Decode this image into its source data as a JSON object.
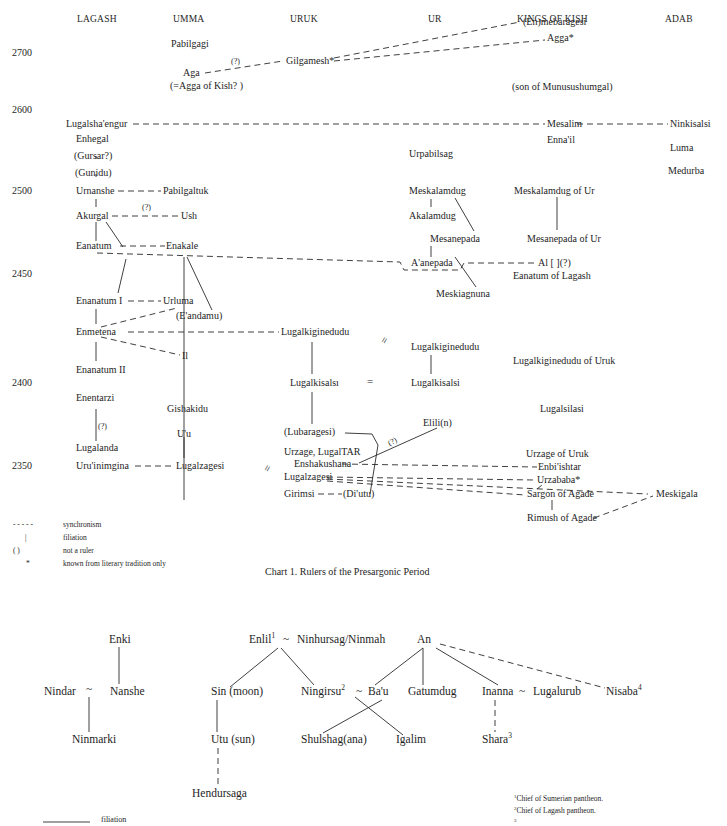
{
  "chart1": {
    "caption": "Chart 1.  Rulers of the Presargonic Period",
    "columns": [
      "LAGASH",
      "UMMA",
      "URUK",
      "UR",
      "KINGS OF KISH",
      "ADAB"
    ],
    "years": [
      "2700",
      "2600",
      "2500",
      "2450",
      "2400",
      "2350"
    ],
    "lagash": [
      "Lugalsha'engur",
      "Enhegal",
      "(Gursar?)",
      "(Gunidu)",
      "Urnanshe",
      "Akurgal",
      "Eanatum",
      "Enanatum I",
      "Enmetena",
      "Enanatum II",
      "Enentarzi",
      "Lugalanda",
      "Uru'inimgina"
    ],
    "umma": [
      "Pabilgagi",
      "Aga",
      "(=Agga of Kish? )",
      "Pabilgaltuk",
      "Ush",
      "Enakale",
      "Urluma",
      "(E'andamu)",
      "Il",
      "Gishakidu",
      "U'u",
      "Lugalzagesi"
    ],
    "uruk": [
      "Gilgamesh*",
      "Lugalkiginedudu",
      "Lugalkisalsı",
      "(Lubaragesi)",
      "Urzage, LugalTAR",
      "Enshakushana",
      "Lugalzagesi",
      "Girimsi",
      "(Di'utu)"
    ],
    "ur": [
      "Urpabilsag",
      "Meskalamdug",
      "Akalamdug",
      "Mesanepada",
      "A'anepada",
      "Meskiagnuna",
      "Lugalkiginedudu",
      "Lugalkisalsi",
      "Elili(n)"
    ],
    "kish": [
      "(En)mebaragesi",
      "Agga*",
      "(son of Munusushumgal)",
      "Mesalim",
      "Enna'il",
      "Meskalamdug of Ur",
      "Mesanepada of Ur",
      "Al [    ](?)",
      "Eanatum of Lagash",
      "Lugalkiginedudu of Uruk",
      "Lugalsilasi",
      "Urzage of Uruk",
      "Enbi'ishtar",
      "Urzababa*",
      "Sargon of Agade",
      "Rimush of Agade"
    ],
    "adab": [
      "Ninkisalsi",
      "Luma",
      "Medurba",
      "Meskigala"
    ],
    "uncertain_mark": "(?)",
    "equals_sign": "=",
    "legend": [
      {
        "symbol": "- - - - -",
        "label": "synchronism"
      },
      {
        "symbol": "|",
        "label": "filiation"
      },
      {
        "symbol": "(        )",
        "label": "not a ruler"
      },
      {
        "symbol": "*",
        "label": "known from literary tradition only"
      }
    ]
  },
  "chart2": {
    "gods": {
      "enki": "Enki",
      "nindar": "Nindar",
      "tilde": "~",
      "nanshe": "Nanshe",
      "ninmarki": "Ninmarki",
      "enlil": "Enlil",
      "enlil_fn": "1",
      "ninhursag": "Ninhursag/Ninmah",
      "an": "An",
      "sin": "Sin (moon)",
      "ningirsu": "Ningirsu",
      "ningirsu_fn": "2",
      "bau": "Ba'u",
      "gatumdug": "Gatumdug",
      "inanna": "Inanna",
      "lugalurub": "Lugalurub",
      "nisaba": "Nisaba",
      "nisaba_fn": "4",
      "utu": "Utu (sun)",
      "shulshag": "Shulshag(ana)",
      "igalim": "Igalim",
      "shara": "Shara",
      "shara_fn": "3",
      "hendursaga": "Hendursaga"
    },
    "legend": {
      "symbol": "________",
      "label": "filiation"
    },
    "footnotes": [
      {
        "n": "1",
        "text": "Chief of Sumerian pantheon."
      },
      {
        "n": "2",
        "text": "Chief of Lagash pantheon."
      },
      {
        "n": "3",
        "text": ""
      }
    ]
  }
}
